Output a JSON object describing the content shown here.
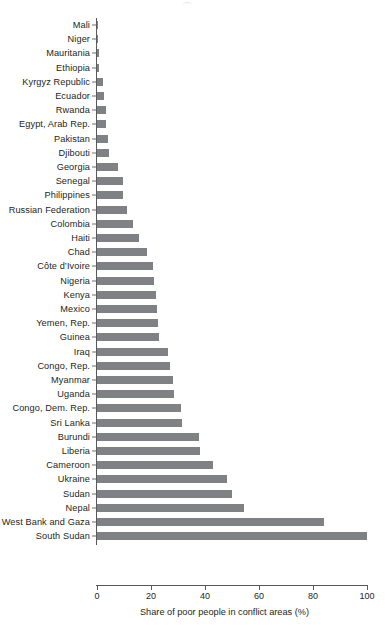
{
  "chart_data": {
    "type": "bar",
    "orientation": "horizontal",
    "title": "",
    "subtitle": "",
    "xlabel": "Share of poor people in conflict areas (%)",
    "ylabel": "",
    "xlim": [
      0,
      100
    ],
    "xticks": [
      0,
      20,
      40,
      60,
      80,
      100
    ],
    "xtick_labels": [
      "0",
      "20",
      "40",
      "60",
      "80",
      "100"
    ],
    "grid": false,
    "legend": null,
    "bar_color": "#808184",
    "axis_color": "#58595b",
    "categories": [
      "Mali",
      "Niger",
      "Mauritania",
      "Ethiopia",
      "Kyrgyz Republic",
      "Ecuador",
      "Rwanda",
      "Egypt, Arab Rep.",
      "Pakistan",
      "Djibouti",
      "Georgia",
      "Senegal",
      "Philippines",
      "Russian Federation",
      "Colombia",
      "Haiti",
      "Chad",
      "Côte d’Ivoire",
      "Nigeria",
      "Kenya",
      "Mexico",
      "Yemen, Rep.",
      "Guinea",
      "Iraq",
      "Congo, Rep.",
      "Myanmar",
      "Uganda",
      "Congo, Dem. Rep.",
      "Sri Lanka",
      "Burundi",
      "Liberia",
      "Cameroon",
      "Ukraine",
      "Sudan",
      "Nepal",
      "West Bank and Gaza",
      "South Sudan"
    ],
    "values": [
      0.4,
      0.5,
      0.6,
      0.8,
      2.4,
      2.6,
      3.2,
      3.4,
      4.2,
      4.6,
      7.6,
      9.6,
      9.8,
      11.0,
      13.2,
      15.6,
      18.4,
      20.6,
      21.0,
      21.8,
      22.2,
      22.6,
      22.8,
      26.2,
      27.0,
      28.2,
      28.4,
      31.2,
      31.6,
      37.6,
      38.0,
      43.0,
      48.0,
      50.0,
      54.6,
      84.0,
      100.0
    ]
  }
}
